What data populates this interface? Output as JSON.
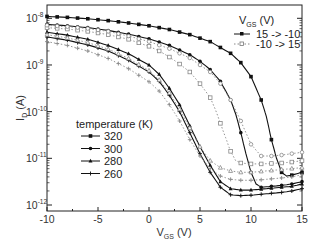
{
  "chart_data": {
    "type": "line",
    "title": "",
    "xlabel": "V_GS (V)",
    "ylabel": "I_D (A)",
    "xlim": [
      -10,
      15
    ],
    "ylim_log10": [
      -12,
      -7.75
    ],
    "yscale": "log",
    "x_ticks": [
      -10,
      -5,
      0,
      5,
      10,
      15
    ],
    "x_tick_labels": [
      "-10",
      "-5",
      "0",
      "5",
      "10",
      "15"
    ],
    "y_ticks_log10": [
      -8,
      -9,
      -10,
      -11,
      -12
    ],
    "y_tick_labels": [
      [
        "10",
        "-8"
      ],
      [
        "10",
        "-9"
      ],
      [
        "10",
        "-10"
      ],
      [
        "10",
        "-11"
      ],
      [
        "10",
        "-12"
      ]
    ],
    "grid": false,
    "legend_vds": {
      "title_main": "V",
      "title_sub": "GS",
      "title_unit": "(V)",
      "entries": [
        {
          "label": "15 -> -10",
          "style": "solid",
          "marker": "filled-square"
        },
        {
          "label": "-10 -> 15",
          "style": "dotted",
          "marker": "open-square"
        }
      ],
      "position": "upper-right"
    },
    "legend_temperature": {
      "title": "temperature (K)",
      "entries": [
        {
          "label": "320",
          "marker": "filled-square"
        },
        {
          "label": "300",
          "marker": "filled-circle"
        },
        {
          "label": "280",
          "marker": "filled-triangle"
        },
        {
          "label": "260",
          "marker": "plus"
        }
      ],
      "position": "lower-left"
    },
    "series": [
      {
        "name": "320 K, 15 -> -10",
        "temperature": 320,
        "sweep": "15 -> -10",
        "style": "solid",
        "marker": "filled-square",
        "x": [
          -10,
          -8,
          -6,
          -4,
          -2,
          0,
          2,
          4,
          6,
          8,
          9,
          10,
          11,
          11.5,
          12,
          12.5,
          13,
          13.5,
          14,
          15
        ],
        "log10_y": [
          -7.96,
          -7.98,
          -8.01,
          -8.05,
          -8.1,
          -8.16,
          -8.24,
          -8.35,
          -8.5,
          -8.75,
          -8.95,
          -9.25,
          -9.75,
          -10.1,
          -10.6,
          -11.0,
          -11.3,
          -11.38,
          -11.36,
          -11.3
        ]
      },
      {
        "name": "300 K, 15 -> -10",
        "temperature": 300,
        "sweep": "15 -> -10",
        "style": "solid",
        "marker": "filled-circle",
        "x": [
          -10,
          -8,
          -6,
          -4,
          -2,
          0,
          2,
          4,
          5,
          6,
          7,
          8,
          8.5,
          9,
          9.5,
          10,
          10.5,
          11,
          12,
          13,
          14,
          15
        ],
        "log10_y": [
          -8.13,
          -8.16,
          -8.2,
          -8.26,
          -8.34,
          -8.44,
          -8.58,
          -8.78,
          -8.92,
          -9.1,
          -9.35,
          -9.75,
          -10.05,
          -10.45,
          -10.9,
          -11.3,
          -11.55,
          -11.62,
          -11.6,
          -11.58,
          -11.55,
          -11.5
        ]
      },
      {
        "name": "300 K, -10 -> 15",
        "temperature": 300,
        "sweep": "-10 -> 15",
        "style": "dotted",
        "marker": "open-square",
        "x": [
          -10,
          -8,
          -6,
          -4,
          -2,
          0,
          1,
          2,
          3,
          4,
          5,
          6,
          6.5,
          7,
          7.5,
          8,
          8.5,
          9,
          10,
          11,
          12,
          13,
          14,
          15
        ],
        "log10_y": [
          -8.2,
          -8.23,
          -8.28,
          -8.35,
          -8.45,
          -8.6,
          -8.7,
          -8.83,
          -8.98,
          -9.15,
          -9.4,
          -9.7,
          -9.95,
          -10.25,
          -10.55,
          -10.85,
          -11.05,
          -11.1,
          -11.12,
          -11.12,
          -11.11,
          -11.1,
          -11.08,
          -11.05
        ]
      },
      {
        "name": "320 K, -10 -> 15",
        "temperature": 320,
        "sweep": "-10 -> 15",
        "style": "dotted",
        "marker": "open-circle",
        "x": [
          -10,
          -8,
          -6,
          -4,
          -2,
          0,
          2,
          4,
          6,
          7,
          8,
          9,
          10,
          11,
          12,
          13,
          14,
          15
        ],
        "log10_y": [
          -8.15,
          -8.18,
          -8.22,
          -8.28,
          -8.38,
          -8.5,
          -8.65,
          -8.85,
          -9.15,
          -9.4,
          -9.75,
          -10.2,
          -10.7,
          -10.95,
          -10.95,
          -10.93,
          -10.9,
          -10.87
        ]
      },
      {
        "name": "280 K, 15 -> -10",
        "temperature": 280,
        "sweep": "15 -> -10",
        "style": "solid",
        "marker": "filled-triangle",
        "x": [
          -10,
          -8,
          -6,
          -4,
          -2,
          0,
          1,
          2,
          3,
          4,
          5,
          6,
          7,
          8,
          9,
          10,
          11,
          12,
          13,
          14,
          15
        ],
        "log10_y": [
          -8.3,
          -8.36,
          -8.45,
          -8.58,
          -8.76,
          -9.0,
          -9.2,
          -9.5,
          -9.85,
          -10.3,
          -10.75,
          -11.15,
          -11.5,
          -11.65,
          -11.68,
          -11.68,
          -11.66,
          -11.64,
          -11.62,
          -11.6,
          -11.55
        ]
      },
      {
        "name": "260 K, 15 -> -10",
        "temperature": 260,
        "sweep": "15 -> -10",
        "style": "solid",
        "marker": "plus",
        "x": [
          -10,
          -8,
          -6,
          -4,
          -2,
          0,
          1,
          2,
          3,
          4,
          5,
          6,
          7,
          8,
          9,
          10,
          11,
          12,
          13,
          14,
          15
        ],
        "log10_y": [
          -8.4,
          -8.47,
          -8.57,
          -8.7,
          -8.9,
          -9.15,
          -9.35,
          -9.65,
          -10.0,
          -10.45,
          -10.9,
          -11.3,
          -11.62,
          -11.78,
          -11.8,
          -11.79,
          -11.77,
          -11.75,
          -11.73,
          -11.7,
          -11.65
        ]
      },
      {
        "name": "280 K, -10 -> 15",
        "temperature": 280,
        "sweep": "-10 -> 15",
        "style": "dotted",
        "marker": "open-triangle",
        "x": [
          -10,
          -8,
          -6,
          -4,
          -2,
          0,
          1,
          2,
          3,
          4,
          5,
          6,
          7,
          8,
          9,
          10,
          11,
          12,
          13,
          14,
          15
        ],
        "log10_y": [
          -8.35,
          -8.42,
          -8.52,
          -8.66,
          -8.86,
          -9.12,
          -9.32,
          -9.6,
          -9.95,
          -10.35,
          -10.75,
          -11.05,
          -11.2,
          -11.27,
          -11.3,
          -11.3,
          -11.28,
          -11.26,
          -11.24,
          -11.22,
          -11.2
        ]
      },
      {
        "name": "260 K, -10 -> 15",
        "temperature": 260,
        "sweep": "-10 -> 15",
        "style": "dotted",
        "marker": "open-plus",
        "x": [
          -10,
          -8,
          -6,
          -4,
          -2,
          0,
          1,
          2,
          3,
          4,
          5,
          6,
          7,
          8,
          9,
          10,
          11,
          12,
          13,
          14,
          15
        ],
        "log10_y": [
          -8.5,
          -8.58,
          -8.7,
          -8.86,
          -9.08,
          -9.36,
          -9.56,
          -9.85,
          -10.2,
          -10.6,
          -10.95,
          -11.22,
          -11.38,
          -11.45,
          -11.47,
          -11.47,
          -11.46,
          -11.44,
          -11.42,
          -11.4,
          -11.35
        ]
      }
    ]
  }
}
